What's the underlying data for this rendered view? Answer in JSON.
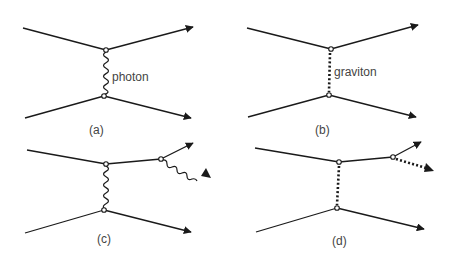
{
  "diagram": {
    "type": "feynman-diagrams",
    "colors": {
      "stroke": "#1a1a1a",
      "text": "#444444",
      "background": "#ffffff"
    },
    "panels": [
      {
        "id": "a",
        "caption": "(a)",
        "mediator": "photon",
        "mediator_label": "photon",
        "mediator_style": "wavy",
        "emission": false
      },
      {
        "id": "b",
        "caption": "(b)",
        "mediator": "graviton",
        "mediator_label": "graviton",
        "mediator_style": "dotted",
        "emission": false
      },
      {
        "id": "c",
        "caption": "(c)",
        "mediator": "photon",
        "mediator_label": "",
        "mediator_style": "wavy",
        "emission": true,
        "emitted_style": "wavy"
      },
      {
        "id": "d",
        "caption": "(d)",
        "mediator": "graviton",
        "mediator_label": "",
        "mediator_style": "dotted",
        "emission": true,
        "emitted_style": "dotted"
      }
    ]
  }
}
